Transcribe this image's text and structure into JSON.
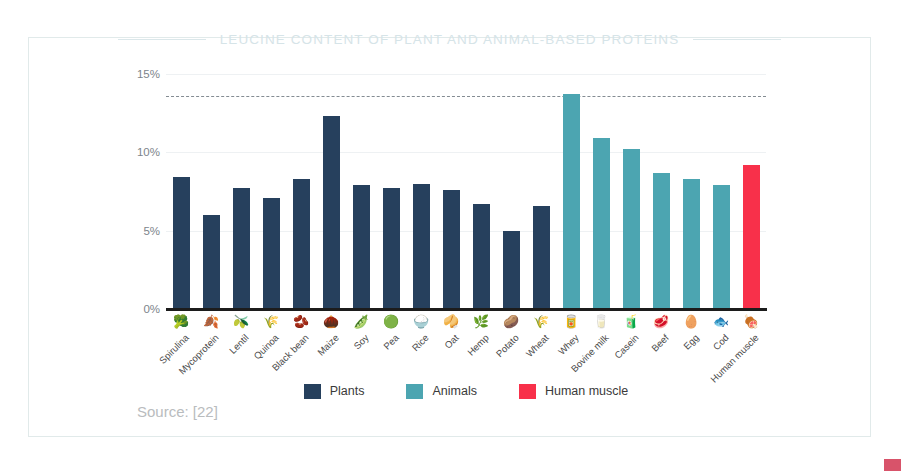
{
  "slide": {
    "title": "LEUCINE CONTENT OF PLANT AND ANIMAL-BASED PROTEINS",
    "source": "Source: [22]"
  },
  "colors": {
    "plants": "#26405d",
    "animals": "#4ca5b1",
    "human": "#f8304a",
    "title": "#d6e4e8",
    "frame": "#e1eaea",
    "gridline": "#eef1f3",
    "axis": "#1c1c1c",
    "source_text": "#b9bcbe",
    "corner_mark": "#d8536a"
  },
  "legend": {
    "position": "bottom-center",
    "items": [
      {
        "label": "Plants",
        "color": "#26405d"
      },
      {
        "label": "Animals",
        "color": "#4ca5b1"
      },
      {
        "label": "Human muscle",
        "color": "#f8304a"
      }
    ]
  },
  "chart_data": {
    "type": "bar",
    "title": "LEUCINE CONTENT OF PLANT AND ANIMAL-BASED PROTEINS",
    "xlabel": "",
    "ylabel": "",
    "ylim": [
      0,
      15
    ],
    "yticks": [
      "0%",
      "5%",
      "10%",
      "15%"
    ],
    "ytick_values": [
      0,
      5,
      10,
      15
    ],
    "grid": true,
    "reference_line": {
      "value": 13.6,
      "style": "dashed",
      "color": "#6f7880"
    },
    "categories": [
      "Spirulina",
      "Mycoprotein",
      "Lentil",
      "Quinoa",
      "Black bean",
      "Maize",
      "Soy",
      "Pea",
      "Rice",
      "Oat",
      "Hemp",
      "Potato",
      "Wheat",
      "Whey",
      "Bovine milk",
      "Casein",
      "Beef",
      "Egg",
      "Cod",
      "Human muscle"
    ],
    "values": [
      8.4,
      6.0,
      7.7,
      7.1,
      8.3,
      12.3,
      7.9,
      7.7,
      8.0,
      7.6,
      6.7,
      5.0,
      6.6,
      13.7,
      10.9,
      10.2,
      8.7,
      8.3,
      7.9,
      9.2
    ],
    "groups": [
      "Plants",
      "Plants",
      "Plants",
      "Plants",
      "Plants",
      "Plants",
      "Plants",
      "Plants",
      "Plants",
      "Plants",
      "Plants",
      "Plants",
      "Plants",
      "Animals",
      "Animals",
      "Animals",
      "Animals",
      "Animals",
      "Animals",
      "Human muscle"
    ],
    "icons": [
      "spirulina-icon",
      "mycoprotein-icon",
      "lentil-icon",
      "quinoa-icon",
      "black-bean-icon",
      "maize-icon",
      "soy-icon",
      "pea-icon",
      "rice-icon",
      "oat-icon",
      "hemp-icon",
      "potato-icon",
      "wheat-icon",
      "whey-icon",
      "bovine-milk-icon",
      "casein-icon",
      "beef-icon",
      "egg-icon",
      "cod-icon",
      "human-muscle-icon"
    ],
    "icon_glyphs": [
      "🥦",
      "🍂",
      "🫒",
      "🌾",
      "🫘",
      "🌰",
      "🫛",
      "🟢",
      "🍚",
      "🥠",
      "🌿",
      "🥔",
      "🌾",
      "🥫",
      "🥛",
      "🧃",
      "🥩",
      "🥚",
      "🐟",
      "🍖"
    ]
  }
}
